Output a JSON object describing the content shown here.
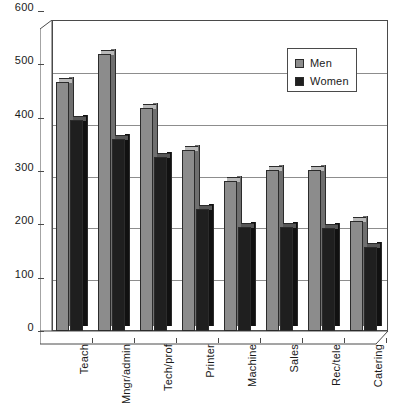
{
  "chart_data": {
    "type": "bar",
    "title": "",
    "subtitle": "",
    "xlabel": "",
    "ylabel": "",
    "categories": [
      "Teach",
      "Mngr/admin",
      "Tech/prof",
      "Printer",
      "Machine",
      "Sales",
      "Rec/tele",
      "Catering"
    ],
    "series": [
      {
        "name": "Men",
        "color": "#8c8c8c",
        "values": [
          480,
          535,
          430,
          350,
          290,
          310,
          310,
          212
        ]
      },
      {
        "name": "Women",
        "color": "#1f1f1f",
        "values": [
          408,
          370,
          335,
          235,
          200,
          200,
          198,
          163
        ]
      }
    ],
    "ylim": [
      0,
      600
    ],
    "yticks": [
      "0",
      "100",
      "200",
      "300",
      "400",
      "500",
      "600"
    ],
    "ytick_values": [
      0,
      100,
      200,
      300,
      400,
      500,
      600
    ],
    "grid": true,
    "legend_position": "upper-right",
    "style": "3d-column"
  },
  "legend": {
    "entries": [
      {
        "label": "Men"
      },
      {
        "label": "Women"
      }
    ]
  },
  "colors": {
    "men_front": "#8c8c8c",
    "men_top": "#b9b9b9",
    "men_side": "#6f6f6f",
    "women_front": "#1f1f1f",
    "women_top": "#575757",
    "women_side": "#111111",
    "axis": "#4a4a4a",
    "grid": "#8d8d8d",
    "background": "#ffffff"
  }
}
